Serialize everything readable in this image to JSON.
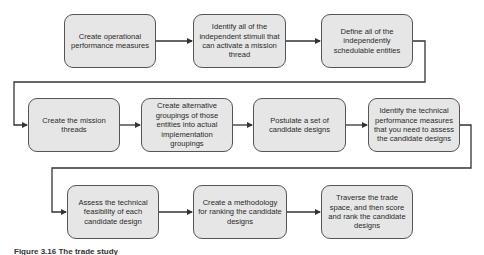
{
  "diagram": {
    "type": "process-flowchart",
    "colors": {
      "box_fill": "#e6e6e6",
      "box_border": "#555555",
      "connector": "#333333",
      "text": "#2a2a2a"
    },
    "steps": [
      {
        "id": 1,
        "label": "Create operational performance measures"
      },
      {
        "id": 2,
        "label": "Identify all of the independent stimuli that can activate a mission thread"
      },
      {
        "id": 3,
        "label": "Define all of the independently schedulable entities"
      },
      {
        "id": 4,
        "label": "Create the mission threads"
      },
      {
        "id": 5,
        "label": "Create alternative groupings of those entities into actual implementation groupings"
      },
      {
        "id": 6,
        "label": "Postulate a set of candidate designs"
      },
      {
        "id": 7,
        "label": "Identify the technical performance measures that you need to assess the candidate designs"
      },
      {
        "id": 8,
        "label": "Assess the technical feasibility of each candidate design"
      },
      {
        "id": 9,
        "label": "Create a methodology for ranking the candidate designs"
      },
      {
        "id": 10,
        "label": "Traverse the trade space, and then score and rank the candidate designs"
      }
    ],
    "edges": [
      {
        "from": 1,
        "to": 2
      },
      {
        "from": 2,
        "to": 3
      },
      {
        "from": 3,
        "to": 4
      },
      {
        "from": 4,
        "to": 5
      },
      {
        "from": 5,
        "to": 6
      },
      {
        "from": 6,
        "to": 7
      },
      {
        "from": 7,
        "to": 8
      },
      {
        "from": 8,
        "to": 9
      },
      {
        "from": 9,
        "to": 10
      }
    ]
  },
  "caption": "Figure 3.16 The trade study"
}
